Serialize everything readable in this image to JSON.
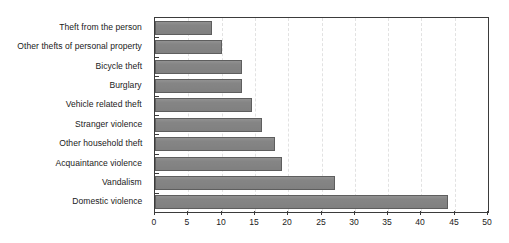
{
  "chart_data": {
    "type": "bar",
    "orientation": "horizontal",
    "title": "",
    "subtitle": "",
    "xlabel": "",
    "ylabel": "",
    "xlim": [
      0,
      50
    ],
    "xticks": [
      0,
      5,
      10,
      15,
      20,
      25,
      30,
      35,
      40,
      45,
      50
    ],
    "xtick_labels": [
      "0",
      "5",
      "10",
      "15",
      "20",
      "25",
      "30",
      "35",
      "40",
      "45",
      "50"
    ],
    "grid": true,
    "grid_axis": "x",
    "grid_style": "dashed",
    "legend": false,
    "legend_position": "none",
    "categories": [
      "Theft from the person",
      "Other thefts of personal property",
      "Bicycle theft",
      "Burglary",
      "Vehicle related theft",
      "Stranger violence",
      "Other household theft",
      "Acquaintance violence",
      "Vandalism",
      "Domestic violence"
    ],
    "values": [
      8.6,
      10.0,
      13.0,
      13.0,
      14.5,
      16.0,
      18.0,
      19.0,
      27.0,
      44.0
    ],
    "bar_color": "#858585",
    "bar_edge_color": "#5e5e5e",
    "axis_color": "#3b3b3b",
    "grid_color": "#e2e2e2",
    "background_color": "#ffffff",
    "text_color": "#1a1a1a"
  }
}
